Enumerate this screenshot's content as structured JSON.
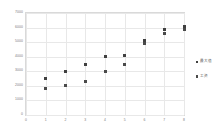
{
  "chart_data": {
    "type": "scatter",
    "title": "",
    "xlabel": "",
    "ylabel": "",
    "xlim": [
      0,
      8
    ],
    "ylim": [
      0,
      7000
    ],
    "grid": true,
    "legend_position": "right",
    "x_ticks": [
      "0",
      "1",
      "2",
      "3",
      "4",
      "5",
      "6",
      "7",
      "8"
    ],
    "y_ticks": [
      "0",
      "1000",
      "2000",
      "3000",
      "4000",
      "5000",
      "6000",
      "7000"
    ],
    "series": [
      {
        "name": "最大值",
        "color": "#404040",
        "marker": "square",
        "points": [
          {
            "x": 1,
            "y": 2500
          },
          {
            "x": 2,
            "y": 3000
          },
          {
            "x": 3,
            "y": 3500
          },
          {
            "x": 4,
            "y": 4000
          },
          {
            "x": 5,
            "y": 4100
          },
          {
            "x": 6,
            "y": 5100
          },
          {
            "x": 7,
            "y": 5900
          },
          {
            "x": 8,
            "y": 6100
          }
        ]
      },
      {
        "name": "工资",
        "color": "#4a4a4a",
        "marker": "square",
        "points": [
          {
            "x": 1,
            "y": 1800
          },
          {
            "x": 2,
            "y": 2000
          },
          {
            "x": 3,
            "y": 2300
          },
          {
            "x": 4,
            "y": 3000
          },
          {
            "x": 5,
            "y": 3500
          },
          {
            "x": 6,
            "y": 4900
          },
          {
            "x": 7,
            "y": 5600
          },
          {
            "x": 8,
            "y": 5900
          }
        ]
      }
    ]
  }
}
